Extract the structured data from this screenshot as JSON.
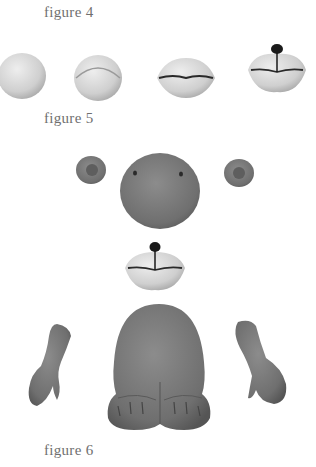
{
  "figures": [
    {
      "label": "figure 4",
      "description": "muzzle forming steps: ball, folded ball, lips, lips with nose"
    },
    {
      "label": "figure 5",
      "description": "head parts: two ears, head ball, muzzle"
    },
    {
      "label": "figure 6",
      "description": "body parts: two arms, body with feet"
    }
  ],
  "colors": {
    "background": "#ffffff",
    "light_clay": "#d9d9d9",
    "dark_clay": "#7a7a7a",
    "caption": "#6f6f6f",
    "nose": "#1a1a1a"
  }
}
